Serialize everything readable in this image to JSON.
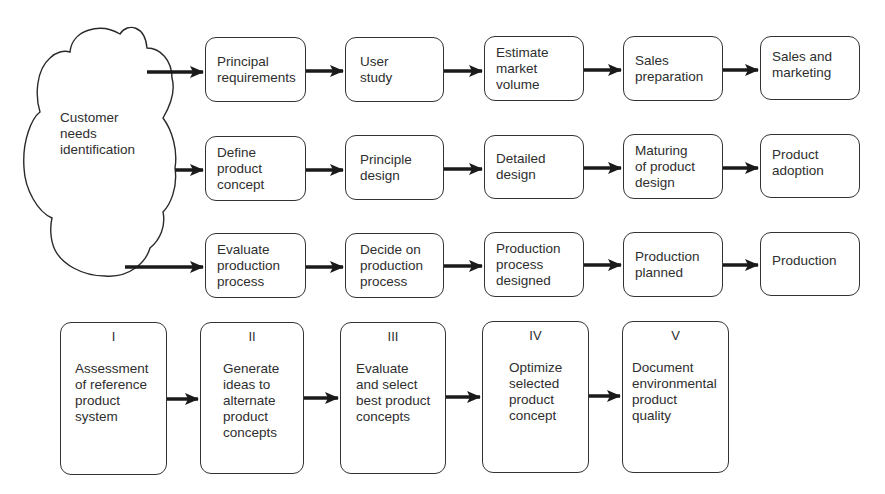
{
  "cloud": {
    "label": "Customer\nneeds\nidentification"
  },
  "rows": [
    {
      "name": "sales-track",
      "boxes": [
        "Principal\nrequirements",
        "User\nstudy",
        "Estimate\nmarket\nvolume",
        "Sales\npreparation",
        "Sales and\nmarketing"
      ]
    },
    {
      "name": "product-track",
      "boxes": [
        "Define\nproduct\nconcept",
        "Principle\ndesign",
        "Detailed\ndesign",
        "Maturing\nof product\ndesign",
        "Product\nadoption"
      ]
    },
    {
      "name": "production-track",
      "boxes": [
        "Evaluate\nproduction\nprocess",
        "Decide on\nproduction\nprocess",
        "Production\nprocess\ndesigned",
        "Production\nplanned",
        "Production"
      ]
    }
  ],
  "stages": [
    {
      "numeral": "I",
      "label": "Assessment\nof reference\nproduct\nsystem"
    },
    {
      "numeral": "II",
      "label": "Generate\nideas to\nalternate\nproduct\nconcepts"
    },
    {
      "numeral": "III",
      "label": "Evaluate\nand select\nbest product\nconcepts"
    },
    {
      "numeral": "IV",
      "label": "Optimize\nselected\nproduct\nconcept"
    },
    {
      "numeral": "V",
      "label": "Document\nenvironmental\nproduct\nquality"
    }
  ],
  "colors": {
    "line": "#1a1a1a",
    "border": "#333333",
    "text": "#2e2e2e",
    "background": "#ffffff"
  }
}
